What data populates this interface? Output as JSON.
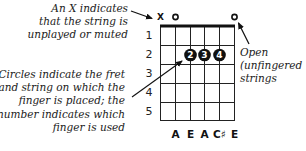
{
  "diagram": {
    "chord_name": "A",
    "captions": {
      "muted": [
        "An X indicates",
        "that the string is",
        "unplayed or muted"
      ],
      "circles": [
        "Circles indicate the fret",
        "and string on which the",
        "finger is placed; the",
        "number indicates which",
        "finger is used"
      ],
      "open": [
        "Open",
        "(unfingered",
        "strings"
      ]
    },
    "string_markers": [
      {
        "string": 1,
        "symbol": "X",
        "meaning": "muted"
      },
      {
        "string": 2,
        "symbol": "O",
        "meaning": "open"
      },
      {
        "string": 6,
        "symbol": "O",
        "meaning": "open"
      }
    ],
    "fret_numbers": [
      "1",
      "2",
      "3",
      "4",
      "5"
    ],
    "fingers": [
      {
        "string": 3,
        "fret": 2,
        "finger": "2"
      },
      {
        "string": 4,
        "fret": 2,
        "finger": "3"
      },
      {
        "string": 5,
        "fret": 2,
        "finger": "4"
      }
    ],
    "notes": [
      {
        "string": 2,
        "label": "A"
      },
      {
        "string": 3,
        "label": "E"
      },
      {
        "string": 4,
        "label": "A"
      },
      {
        "string": 5,
        "label": "C♯"
      },
      {
        "string": 6,
        "label": "E"
      }
    ],
    "colors": {
      "ink": "#111111",
      "finger_fill": "#111111",
      "finger_text": "#ffffff",
      "background": "#ffffff"
    }
  }
}
